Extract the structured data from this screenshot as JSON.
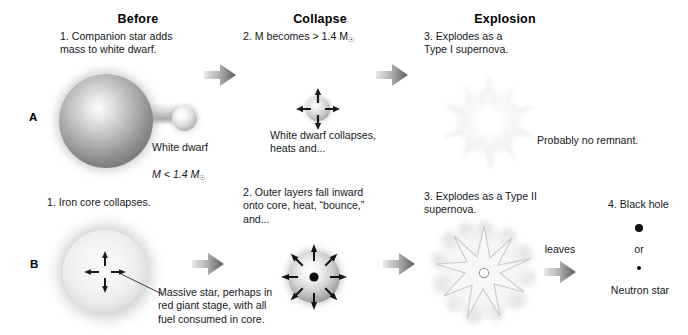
{
  "figure": {
    "title_row_labels": {
      "a": "A",
      "b": "B"
    },
    "columns": [
      {
        "key": "before",
        "label": "Before"
      },
      {
        "key": "collapse",
        "label": "Collapse"
      },
      {
        "key": "explosion",
        "label": "Explosion"
      }
    ]
  },
  "row_a": {
    "label": "A",
    "step1": "1. Companion star adds\n    mass to white dwarf.",
    "step1_caption": "White dwarf\nM < 1.4 M",
    "step1_caption_line1": "White dwarf",
    "step1_caption_mass": "M < 1.4 M",
    "step1_caption_mass_sub": "☉",
    "step2": "2. M becomes > 1.4 M",
    "step2_sub": "☉",
    "step2_caption": "White dwarf collapses,\nheats and...",
    "step3": "3. Explodes as a\n    Type I supernova.",
    "step3_caption": "Probably no remnant."
  },
  "row_b": {
    "label": "B",
    "step1": "1. Iron core collapses.",
    "step1_caption": "Massive star, perhaps in\nred giant stage, with all\nfuel consumed in core.",
    "step2": "2. Outer layers fall inward\n    onto core, heat, “bounce,”\n    and...",
    "step3": "3. Explodes as a Type II\n    supernova.",
    "leaves_label": "leaves",
    "step4": "4. Black hole",
    "or_label": "or",
    "neutron_label": "Neutron star"
  },
  "colors": {
    "background": "#ffffff",
    "text": "#16181a",
    "heading": "#000000",
    "arrow_dark": "#6f6f6f",
    "arrow_light": "#d9d9d9",
    "star_fill": "#f0f0f0",
    "remnant_dot": "#111111"
  },
  "icons": {
    "arrow": "block-arrow-right",
    "sun_symbol": "☉"
  }
}
